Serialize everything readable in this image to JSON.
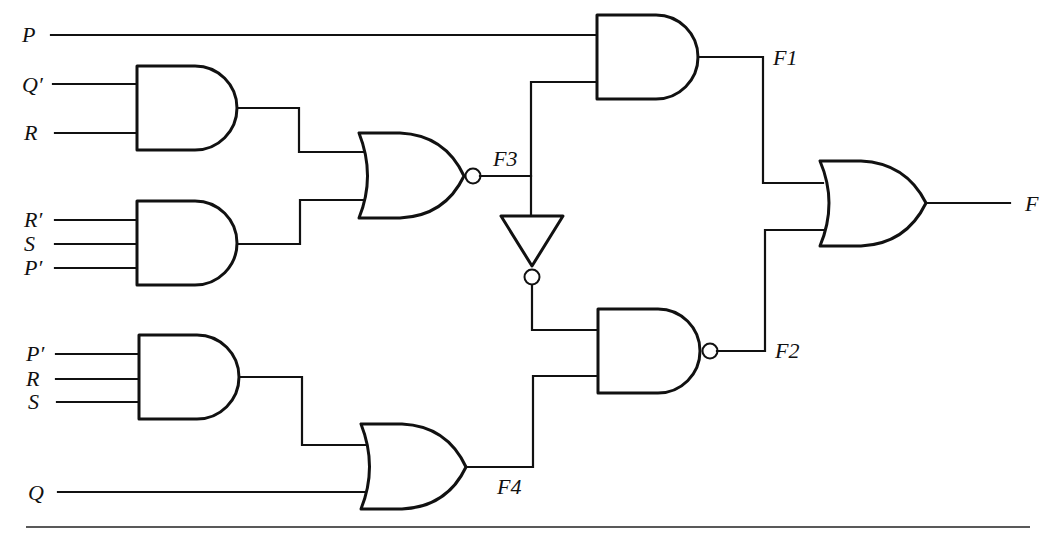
{
  "figure": {
    "type": "combinational logic circuit",
    "colors": {
      "ink": "#111111",
      "background": "#ffffff"
    }
  },
  "inputs": {
    "P": "P",
    "Qp": "Q′",
    "R1": "R",
    "Rp": "R′",
    "S1": "S",
    "Pp1": "P′",
    "Pp2": "P′",
    "R2": "R",
    "S2": "S",
    "Q": "Q"
  },
  "signals": {
    "F1": "F1",
    "F2": "F2",
    "F3": "F3",
    "F4": "F4",
    "F": "F"
  },
  "gates": [
    {
      "id": "and_a",
      "type": "AND",
      "inputs": [
        "Q′",
        "R"
      ],
      "output": "to NOR"
    },
    {
      "id": "and_b",
      "type": "AND",
      "inputs": [
        "R′",
        "S",
        "P′"
      ],
      "output": "to NOR"
    },
    {
      "id": "nor_f3",
      "type": "NOR",
      "inputs": [
        "and_a",
        "and_b"
      ],
      "output": "F3"
    },
    {
      "id": "not_f3",
      "type": "NOT",
      "inputs": [
        "F3"
      ],
      "output": "to NAND"
    },
    {
      "id": "and_f1",
      "type": "AND",
      "inputs": [
        "P",
        "F3"
      ],
      "output": "F1"
    },
    {
      "id": "and_c",
      "type": "AND",
      "inputs": [
        "P′",
        "R",
        "S"
      ],
      "output": "to OR F4"
    },
    {
      "id": "or_f4",
      "type": "OR",
      "inputs": [
        "and_c",
        "Q"
      ],
      "output": "F4"
    },
    {
      "id": "nand_f2",
      "type": "NAND",
      "inputs": [
        "F3′",
        "F4"
      ],
      "output": "F2"
    },
    {
      "id": "or_f",
      "type": "OR",
      "inputs": [
        "F1",
        "F2"
      ],
      "output": "F"
    }
  ]
}
